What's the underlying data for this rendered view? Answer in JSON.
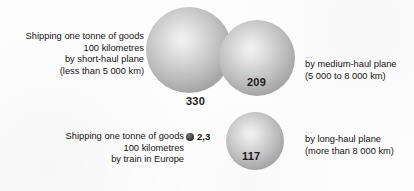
{
  "chart_data": {
    "type": "bar",
    "title": "",
    "xlabel": "",
    "ylabel": "grams of CO2 per tonne-kilometre",
    "categories": [
      "Shipping one tonne of goods 100 kilometres by short-haul plane (less than 5 000 km)",
      "Shipping one tonne of goods 100 kilometres by medium-haul plane (5 000 to 8 000 km)",
      "Shipping one tonne of goods 100 kilometres by long-haul plane (more than 8 000 km)",
      "Shipping one tonne of goods 100 kilometres by train in Europe"
    ],
    "values": [
      330,
      209,
      117,
      2.3
    ],
    "value_labels": [
      "330",
      "209",
      "117",
      "2,3"
    ],
    "encoding": "area-proportional circles",
    "grid": false,
    "legend": "none"
  },
  "figure": {
    "background_color": "#fdfdfd",
    "sphere_light_color": "#f2f2f2",
    "sphere_dark_color": "#8f8f8f",
    "train_dot_color": "#2b2b2b",
    "text_color": "#141414"
  },
  "items": {
    "short_haul": {
      "value": "330",
      "caption_lines": [
        "Shipping one tonne of goods",
        "100 kilometres",
        "by short-haul plane",
        "(less than 5 000 km)"
      ]
    },
    "medium_haul": {
      "value": "209",
      "leader": "...",
      "caption_lines": [
        "by medium-haul plane",
        "(5 000 to 8 000 km)"
      ]
    },
    "long_haul": {
      "value": "117",
      "leader": "...",
      "caption_lines": [
        "by long-haul plane",
        "(more than 8 000 km)"
      ]
    },
    "train": {
      "value": "2,3",
      "caption_lines": [
        "Shipping one tonne of goods",
        "100 kilometres",
        "by train in Europe"
      ]
    }
  }
}
